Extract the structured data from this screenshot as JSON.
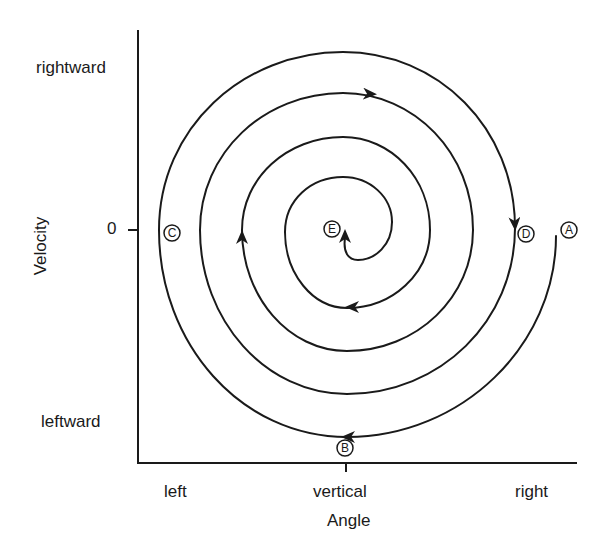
{
  "diagram": {
    "type": "phase-portrait-spiral",
    "x_axis": {
      "title": "Angle",
      "ticks": [
        "left",
        "vertical",
        "right"
      ]
    },
    "y_axis": {
      "title": "Velocity",
      "ticks": [
        "rightward",
        "0",
        "leftward"
      ]
    },
    "points": [
      {
        "id": "A",
        "label": "A",
        "meaning": "start, displaced right, zero velocity"
      },
      {
        "id": "B",
        "label": "B",
        "meaning": "vertical, max leftward velocity"
      },
      {
        "id": "C",
        "label": "C",
        "meaning": "left extreme, zero velocity"
      },
      {
        "id": "D",
        "label": "D",
        "meaning": "right extreme, zero velocity"
      },
      {
        "id": "E",
        "label": "E",
        "meaning": "rest equilibrium at vertical"
      }
    ],
    "flow": "clockwise inward spiral from A through B, C, D to E",
    "stroke_color": "#1a1a1a",
    "background": "#ffffff"
  }
}
